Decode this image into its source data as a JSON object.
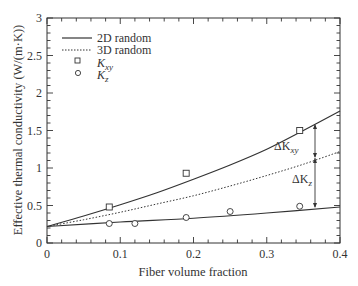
{
  "chart_data": {
    "type": "line",
    "title": "",
    "xlabel": "Fiber volume fraction",
    "ylabel": "Effective thermal conductivity (W/(m·K))",
    "xlim": [
      0,
      0.4
    ],
    "ylim": [
      0,
      3
    ],
    "xticks": [
      "0",
      "0.1",
      "0.2",
      "0.3",
      "0.4"
    ],
    "yticks": [
      "0",
      "0.5",
      "1",
      "1.5",
      "2",
      "2.5",
      "3"
    ],
    "grid": false,
    "legend_position": "upper left",
    "series": [
      {
        "name": "2D random",
        "style": "solid",
        "x": [
          0,
          0.05,
          0.1,
          0.15,
          0.2,
          0.25,
          0.3,
          0.35,
          0.4
        ],
        "y": [
          0.22,
          0.36,
          0.51,
          0.67,
          0.85,
          1.04,
          1.25,
          1.5,
          1.76
        ]
      },
      {
        "name": "3D random",
        "style": "dotted",
        "x": [
          0,
          0.05,
          0.1,
          0.15,
          0.2,
          0.25,
          0.3,
          0.35,
          0.4
        ],
        "y": [
          0.22,
          0.31,
          0.41,
          0.52,
          0.63,
          0.76,
          0.9,
          1.05,
          1.22
        ]
      },
      {
        "name": "Kz model",
        "style": "solid",
        "x": [
          0,
          0.1,
          0.2,
          0.3,
          0.4
        ],
        "y": [
          0.22,
          0.28,
          0.33,
          0.4,
          0.48
        ]
      },
      {
        "name": "Kxy",
        "style": "marker-square",
        "x": [
          0.085,
          0.19,
          0.345
        ],
        "y": [
          0.48,
          0.93,
          1.5
        ]
      },
      {
        "name": "Kz",
        "style": "marker-circle",
        "x": [
          0.085,
          0.12,
          0.19,
          0.25,
          0.345
        ],
        "y": [
          0.26,
          0.26,
          0.34,
          0.42,
          0.49
        ]
      }
    ],
    "legend": [
      "2D random",
      "3D random",
      "K_xy",
      "K_z"
    ],
    "annotations": [
      {
        "text": "ΔK_xy",
        "x": 0.37,
        "y_from": 1.14,
        "y_to": 1.57
      },
      {
        "text": "ΔK_z",
        "x": 0.37,
        "y_from": 0.46,
        "y_to": 1.14
      }
    ]
  },
  "labels": {
    "legend_2d": "2D random",
    "legend_3d": "3D random",
    "legend_kxy_main": "K",
    "legend_kxy_sub": "xy",
    "legend_kz_main": "K",
    "legend_kz_sub": "z",
    "ann_dkxy_main": "ΔK",
    "ann_dkxy_sub": "xy",
    "ann_dkz_main": "ΔK",
    "ann_dkz_sub": "z",
    "xlabel": "Fiber volume fraction",
    "ylabel": "Effective thermal conductivity (W/(m·K))"
  }
}
